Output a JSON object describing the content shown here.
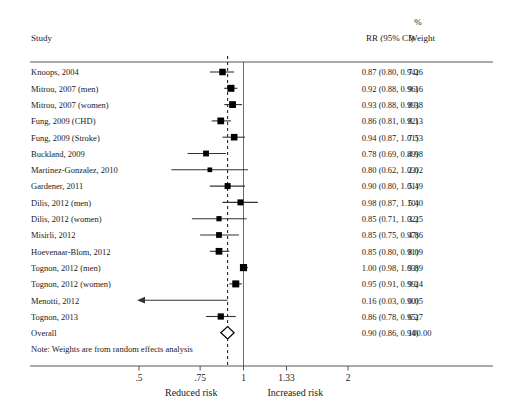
{
  "headers": {
    "study": "Study",
    "effect": "RR (95% CI)",
    "weight_pct": "%",
    "weight": "Weight"
  },
  "note": "Note: Weights are from random effects analysis",
  "axis": {
    "ticks": [
      ".5",
      ".75",
      "1",
      "1.33",
      "2"
    ],
    "tick_values": [
      0.5,
      0.75,
      1,
      1.33,
      2
    ],
    "left_label": "Reduced risk",
    "right_label": "Increased risk",
    "scale": "log",
    "null_line": 1,
    "pooled_line": 0.9
  },
  "colors": {
    "marker": "#000000",
    "line": "#333333",
    "rule": "#555555",
    "text": "#1a1a1a"
  },
  "chart_data": {
    "type": "forest",
    "title": "",
    "xlabel": "",
    "ylabel": "",
    "xlim": [
      0.45,
      2.2
    ],
    "scale": "log",
    "grid": false,
    "null_value": 1,
    "pooled_value": 0.9,
    "columns": [
      "Study",
      "RR (95% CI)",
      "% Weight"
    ],
    "rows": [
      {
        "study": "Knoops, 2004",
        "rr": 0.87,
        "lo": 0.8,
        "hi": 0.94,
        "effect": "0.87 (0.80, 0.94)",
        "weight": 7.26,
        "weight_label": "7.26",
        "arrow_left": false
      },
      {
        "study": "Mitrou, 2007 (men)",
        "rr": 0.92,
        "lo": 0.88,
        "hi": 0.96,
        "effect": "0.92 (0.88, 0.96)",
        "weight": 9.16,
        "weight_label": "9.16",
        "arrow_left": false
      },
      {
        "study": "Mitrou, 2007 (women)",
        "rr": 0.93,
        "lo": 0.88,
        "hi": 0.99,
        "effect": "0.93 (0.88, 0.99)",
        "weight": 8.38,
        "weight_label": "8.38",
        "arrow_left": false
      },
      {
        "study": "Fung, 2009 (CHD)",
        "rr": 0.86,
        "lo": 0.81,
        "hi": 0.92,
        "effect": "0.86 (0.81, 0.92)",
        "weight": 8.13,
        "weight_label": "8.13",
        "arrow_left": false
      },
      {
        "study": "Fung, 2009 (Stroke)",
        "rr": 0.94,
        "lo": 0.87,
        "hi": 1.01,
        "effect": "0.94 (0.87, 1.01)",
        "weight": 7.53,
        "weight_label": "7.53",
        "arrow_left": false
      },
      {
        "study": "Buckland, 2009",
        "rr": 0.78,
        "lo": 0.69,
        "hi": 0.89,
        "effect": "0.78 (0.69, 0.89)",
        "weight": 4.98,
        "weight_label": "4.98",
        "arrow_left": false
      },
      {
        "study": "Martinez-Gonzalez, 2010",
        "rr": 0.8,
        "lo": 0.62,
        "hi": 1.03,
        "effect": "0.80 (0.62, 1.03)",
        "weight": 2.02,
        "weight_label": "2.02",
        "arrow_left": false
      },
      {
        "study": "Gardener, 2011",
        "rr": 0.9,
        "lo": 0.8,
        "hi": 1.01,
        "effect": "0.90 (0.80, 1.01)",
        "weight": 5.49,
        "weight_label": "5.49",
        "arrow_left": false
      },
      {
        "study": "Dilis, 2012 (men)",
        "rr": 0.98,
        "lo": 0.87,
        "hi": 1.1,
        "effect": "0.98 (0.87, 1.10)",
        "weight": 5.4,
        "weight_label": "5.40",
        "arrow_left": false
      },
      {
        "study": "Dilis, 2012 (women)",
        "rr": 0.85,
        "lo": 0.71,
        "hi": 1.02,
        "effect": "0.85 (0.71, 1.02)",
        "weight": 3.25,
        "weight_label": "3.25",
        "arrow_left": false
      },
      {
        "study": "Misirli, 2012",
        "rr": 0.85,
        "lo": 0.75,
        "hi": 0.97,
        "effect": "0.85 (0.75, 0.97)",
        "weight": 4.86,
        "weight_label": "4.86",
        "arrow_left": false
      },
      {
        "study": "Hoevenaar-Blom, 2012",
        "rr": 0.85,
        "lo": 0.8,
        "hi": 0.91,
        "effect": "0.85 (0.80, 0.91)",
        "weight": 8.09,
        "weight_label": "8.09",
        "arrow_left": false
      },
      {
        "study": "Tognon, 2012 (men)",
        "rr": 1.0,
        "lo": 0.98,
        "hi": 1.03,
        "effect": "1.00 (0.98, 1.03)",
        "weight": 9.89,
        "weight_label": "9.89",
        "arrow_left": false
      },
      {
        "study": "Tognon, 2012 (women)",
        "rr": 0.95,
        "lo": 0.91,
        "hi": 0.99,
        "effect": "0.95 (0.91, 0.99)",
        "weight": 9.24,
        "weight_label": "9.24",
        "arrow_left": false
      },
      {
        "study": "Menotti, 2012",
        "rr": 0.16,
        "lo": 0.03,
        "hi": 0.9,
        "effect": "0.16 (0.03, 0.90)",
        "weight": 0.05,
        "weight_label": "0.05",
        "arrow_left": true
      },
      {
        "study": "Tognon, 2013",
        "rr": 0.86,
        "lo": 0.78,
        "hi": 0.95,
        "effect": "0.86 (0.78, 0.95)",
        "weight": 6.27,
        "weight_label": "6.27",
        "arrow_left": false
      }
    ],
    "overall": {
      "study": "Overall",
      "rr": 0.9,
      "lo": 0.86,
      "hi": 0.94,
      "effect": "0.90 (0.86, 0.94)",
      "weight": 100.0,
      "weight_label": "100.00"
    }
  }
}
